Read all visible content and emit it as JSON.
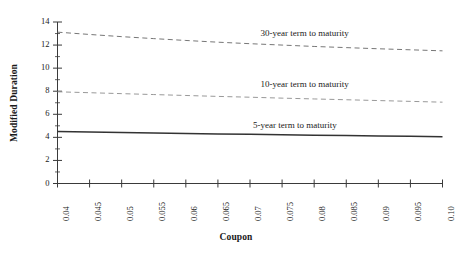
{
  "chart_data": {
    "type": "line",
    "title": "",
    "subtitle": "",
    "xlabel": "Coupon",
    "ylabel": "Modified Duration",
    "xlim": [
      0.04,
      0.1
    ],
    "ylim": [
      0,
      14
    ],
    "grid": false,
    "legend_position": "inline-annotations",
    "x_tick_labels": [
      "0.04",
      "0.045",
      "0.05",
      "0.055",
      "0.06",
      "0.065",
      "0.07",
      "0.075",
      "0.08",
      "0.085",
      "0.09",
      "0.095",
      "0.10"
    ],
    "x_tick_values": [
      0.04,
      0.045,
      0.05,
      0.055,
      0.06,
      0.065,
      0.07,
      0.075,
      0.08,
      0.085,
      0.09,
      0.095,
      0.1
    ],
    "y_tick_labels": [
      "0",
      "2",
      "4",
      "6",
      "8",
      "10",
      "12",
      "14"
    ],
    "y_tick_values": [
      0,
      2,
      4,
      6,
      8,
      10,
      12,
      14
    ],
    "y_minor_tick_values": [
      1,
      3,
      5,
      7,
      9,
      11,
      13
    ],
    "x": [
      0.04,
      0.045,
      0.05,
      0.055,
      0.06,
      0.065,
      0.07,
      0.075,
      0.08,
      0.085,
      0.09,
      0.095,
      0.1
    ],
    "series": [
      {
        "name": "30-year term to maturity",
        "label": "30-year term to maturity",
        "style": "dashed",
        "color": "#777777",
        "values": [
          13.12,
          12.92,
          12.73,
          12.56,
          12.4,
          12.25,
          12.12,
          12.0,
          11.88,
          11.78,
          11.68,
          11.59,
          11.5
        ]
      },
      {
        "name": "10-year term to maturity",
        "label": "10-year term to maturity",
        "style": "dashed",
        "color": "#999999",
        "values": [
          7.95,
          7.87,
          7.79,
          7.71,
          7.63,
          7.55,
          7.48,
          7.4,
          7.33,
          7.26,
          7.19,
          7.12,
          7.05
        ]
      },
      {
        "name": "5-year term to maturity",
        "label": "5-year term to maturity",
        "style": "solid",
        "color": "#333333",
        "values": [
          4.5,
          4.46,
          4.42,
          4.38,
          4.34,
          4.3,
          4.26,
          4.23,
          4.19,
          4.16,
          4.12,
          4.09,
          4.06
        ]
      }
    ],
    "annotations": [
      {
        "text": "30-year term to maturity",
        "x": 0.0785,
        "y": 13.0
      },
      {
        "text": "10-year term to maturity",
        "x": 0.0785,
        "y": 8.55
      },
      {
        "text": "5-year term to maturity",
        "x": 0.077,
        "y": 4.95
      }
    ],
    "axis_color": "#3a3a3a"
  }
}
